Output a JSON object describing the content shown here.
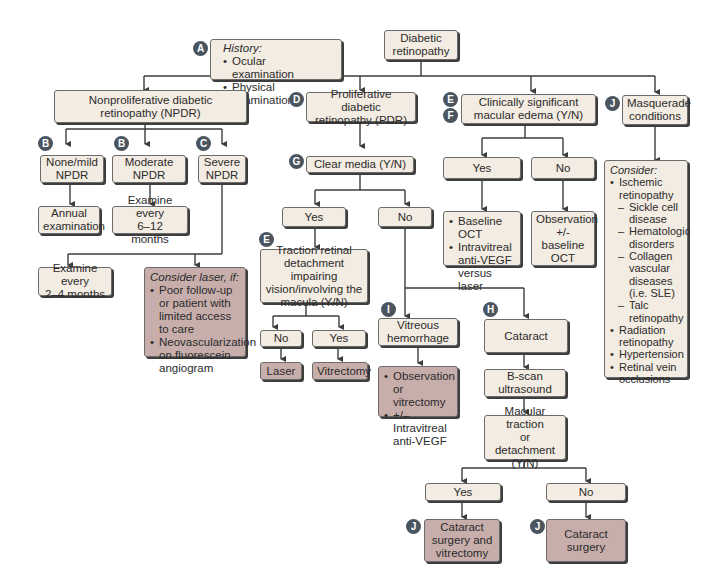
{
  "diagram": {
    "title": "Diabetic retinopathy",
    "colors": {
      "box_fill": "#f3ece2",
      "treatment_fill": "#c7aeab",
      "badge": "#4a5560",
      "line": "#3d3d3d"
    },
    "nodes": {
      "root": {
        "lines": [
          "Diabetic",
          "retinopathy"
        ]
      },
      "history": {
        "badge": "A",
        "heading": "History:",
        "items": [
          "Ocular examination",
          "Physical examination"
        ]
      },
      "npdr": {
        "lines": [
          "Nonproliferative diabetic",
          "retinopathy (NPDR)"
        ]
      },
      "pdr": {
        "badge": "D",
        "lines": [
          "Proliferative diabetic",
          "retinopathy (PDR)"
        ]
      },
      "csme": {
        "badges": [
          "E",
          "F"
        ],
        "lines": [
          "Clinically significant",
          "macular edema (Y/N)"
        ]
      },
      "masquerade": {
        "badge": "J",
        "lines": [
          "Masquerade",
          "conditions"
        ]
      },
      "none_mild": {
        "badge": "B",
        "lines": [
          "None/mild",
          "NPDR"
        ]
      },
      "moderate": {
        "badge": "B",
        "lines": [
          "Moderate",
          "NPDR"
        ]
      },
      "severe": {
        "badge": "C",
        "lines": [
          "Severe",
          "NPDR"
        ]
      },
      "annual": {
        "lines": [
          "Annual",
          "examination"
        ]
      },
      "exam_6_12": {
        "lines": [
          "Examine every",
          "6–12 months"
        ]
      },
      "exam_2_4": {
        "lines": [
          "Examine every",
          "2–4 months"
        ]
      },
      "consider_laser": {
        "heading": "Consider laser, if:",
        "items": [
          "Poor follow-up or patient with limited access to care",
          "Neovascularization on fluorescein angiogram"
        ]
      },
      "clear_media": {
        "badge": "G",
        "lines": [
          "Clear media (Y/N)"
        ]
      },
      "cm_yes": {
        "lines": [
          "Yes"
        ]
      },
      "cm_no": {
        "lines": [
          "No"
        ]
      },
      "traction": {
        "badge": "E",
        "lines": [
          "Traction retinal",
          "detachment impairing",
          "vision/involving the",
          "macula (Y/N)"
        ]
      },
      "tr_no": {
        "lines": [
          "No"
        ]
      },
      "tr_yes": {
        "lines": [
          "Yes"
        ]
      },
      "laser": {
        "lines": [
          "Laser"
        ]
      },
      "vitrectomy": {
        "lines": [
          "Vitrectomy"
        ]
      },
      "vitreous_hemorrhage": {
        "badge": "I",
        "lines": [
          "Vitreous",
          "hemorrhage"
        ]
      },
      "vh_treatment": {
        "items": [
          "Observation or vitrectomy",
          "+/– Intravitreal anti-VEGF"
        ]
      },
      "cataract": {
        "badge": "H",
        "lines": [
          "Cataract"
        ]
      },
      "bscan": {
        "lines": [
          "B-scan",
          "ultrasound"
        ]
      },
      "macular_traction": {
        "lines": [
          "Macular traction",
          "or detachment",
          "(Y/N)"
        ]
      },
      "mt_yes": {
        "lines": [
          "Yes"
        ]
      },
      "mt_no": {
        "lines": [
          "No"
        ]
      },
      "cat_vit": {
        "badge": "J",
        "lines": [
          "Cataract",
          "surgery and",
          "vitrectomy"
        ]
      },
      "cat_surg": {
        "badge": "J",
        "lines": [
          "Cataract",
          "surgery"
        ]
      },
      "csme_yes": {
        "lines": [
          "Yes"
        ]
      },
      "csme_no": {
        "lines": [
          "No"
        ]
      },
      "csme_yes_tx": {
        "items": [
          "Baseline OCT",
          "Intravitreal anti-VEGF versus laser"
        ]
      },
      "csme_no_tx": {
        "lines": [
          "Observation",
          "+/-",
          "baseline",
          "OCT"
        ]
      },
      "masq_list": {
        "heading": "Consider:",
        "items": [
          {
            "text": "Ischemic retinopathy",
            "level": 1
          },
          {
            "text": "Sickle cell disease",
            "level": 2
          },
          {
            "text": "Hematologic disorders",
            "level": 2
          },
          {
            "text": "Collagen vascular diseases (i.e. SLE)",
            "level": 2
          },
          {
            "text": "Talc retinopathy",
            "level": 2
          },
          {
            "text": "Radiation retinopathy",
            "level": 1
          },
          {
            "text": "Hypertension",
            "level": 1
          },
          {
            "text": "Retinal vein occlusions",
            "level": 1
          }
        ]
      }
    }
  }
}
